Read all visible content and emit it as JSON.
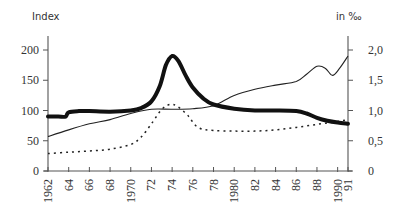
{
  "chart_data": {
    "type": "line",
    "title": "",
    "left_axis_label": "Index",
    "right_axis_label": "in ‰",
    "xlabel": "",
    "x_ticks": [
      "1962",
      "64",
      "66",
      "68",
      "1970",
      "72",
      "74",
      "76",
      "78",
      "1980",
      "82",
      "84",
      "86",
      "88",
      "1990",
      "91"
    ],
    "x_tick_years": [
      1962,
      1964,
      1966,
      1968,
      1970,
      1972,
      1974,
      1976,
      1978,
      1980,
      1982,
      1984,
      1986,
      1988,
      1990,
      1991
    ],
    "xlim": [
      1962,
      1991
    ],
    "left_ticks": [
      "0",
      "50",
      "100",
      "150",
      "200"
    ],
    "left_ylim": [
      0,
      230
    ],
    "right_ticks": [
      "0",
      "0,5",
      "1,0",
      "1,5",
      "2,0"
    ],
    "right_ylim": [
      0,
      2.3
    ],
    "grid": false,
    "legend": "none",
    "series": [
      {
        "name": "thick-line-index",
        "axis": "left",
        "style": "thick-solid",
        "x": [
          1962,
          1963,
          1963.7,
          1964,
          1965,
          1966,
          1968,
          1970,
          1971,
          1972,
          1972.8,
          1973.4,
          1974,
          1974.6,
          1975.3,
          1976,
          1977,
          1978,
          1980,
          1982,
          1984,
          1986,
          1987,
          1988,
          1989,
          1990,
          1991
        ],
        "values": [
          90,
          90,
          90,
          97,
          99,
          99,
          98,
          100,
          104,
          115,
          140,
          175,
          190,
          182,
          158,
          138,
          120,
          110,
          103,
          100,
          100,
          99,
          95,
          88,
          83,
          80,
          78
        ]
      },
      {
        "name": "thin-line-index",
        "axis": "left",
        "style": "thin-solid",
        "x": [
          1962,
          1964,
          1966,
          1968,
          1970,
          1972,
          1974,
          1976,
          1978,
          1980,
          1982,
          1984,
          1986,
          1987,
          1988,
          1988.8,
          1989.5,
          1990.2,
          1991
        ],
        "values": [
          57,
          68,
          78,
          85,
          95,
          102,
          102,
          103,
          108,
          125,
          135,
          142,
          148,
          160,
          173,
          170,
          158,
          170,
          190
        ]
      },
      {
        "name": "dotted-line-permille",
        "axis": "right",
        "style": "dotted",
        "x": [
          1962,
          1964,
          1966,
          1968,
          1970,
          1971,
          1972,
          1973,
          1973.8,
          1974.5,
          1975.5,
          1976.5,
          1978,
          1980,
          1982,
          1984,
          1986,
          1988,
          1990,
          1991
        ],
        "values": [
          0.29,
          0.31,
          0.33,
          0.36,
          0.44,
          0.56,
          0.78,
          1.02,
          1.1,
          1.07,
          0.92,
          0.72,
          0.67,
          0.66,
          0.66,
          0.68,
          0.72,
          0.77,
          0.82,
          0.85
        ]
      }
    ]
  }
}
